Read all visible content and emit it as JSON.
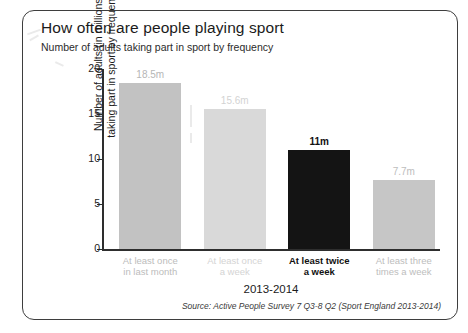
{
  "card": {
    "title": "How often are people playing sport",
    "subtitle": "Number of adults taking part in sport by frequency",
    "source": "Source: Active People Survey 7 Q3-8 Q2 (Sport England 2013-2014)"
  },
  "chart_data": {
    "type": "bar",
    "title": "How often are people playing sport",
    "subtitle": "Number of adults taking part in sport by frequency",
    "xlabel": "2013-2014",
    "ylabel": "Number of adults (in millions) taking part in sport by frequency",
    "ylabel_line1": "Number of adults (in millions)",
    "ylabel_line2": "taking part in sport by frequency",
    "ylim": [
      0,
      20
    ],
    "yticks": [
      0,
      5,
      10,
      15,
      20
    ],
    "ytick_labels": [
      "0",
      "5",
      "10",
      "15",
      "20"
    ],
    "grid": false,
    "legend": "none",
    "categories": [
      "At least once in last month",
      "At least once a week",
      "At least twice a week",
      "At least three times a week"
    ],
    "category_lines": [
      [
        "At least once",
        "in last month"
      ],
      [
        "At least once",
        "a week"
      ],
      [
        "At least twice",
        "a week"
      ],
      [
        "At least three",
        "times a week"
      ]
    ],
    "values": [
      18.5,
      15.6,
      11,
      7.7
    ],
    "value_labels": [
      "18.5m",
      "15.6m",
      "11m",
      "7.7m"
    ],
    "bar_colors": [
      "#c2c2c2",
      "#d9d9d9",
      "#141414",
      "#c6c6c6"
    ],
    "label_colors": [
      "#b6b6b6",
      "#d3d3d3",
      "#111111",
      "#bdbdbd"
    ],
    "category_label_colors": [
      "#bcbcbc",
      "#d4d4d4",
      "#111111",
      "#bdbdbd"
    ],
    "highlight_index": 2,
    "source": "Source: Active People Survey 7 Q3-8 Q2 (Sport England 2013-2014)"
  }
}
